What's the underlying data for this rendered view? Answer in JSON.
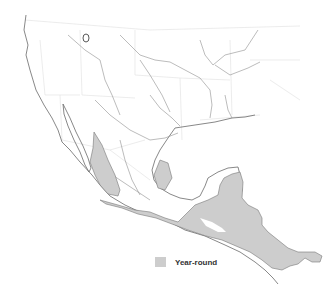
{
  "map": {
    "region": "Mexico and Central America",
    "background_color": "#ffffff",
    "range_color": "#cdcdcd",
    "legend": [
      {
        "label": "Year-round",
        "color": "#cdcdcd"
      }
    ]
  }
}
